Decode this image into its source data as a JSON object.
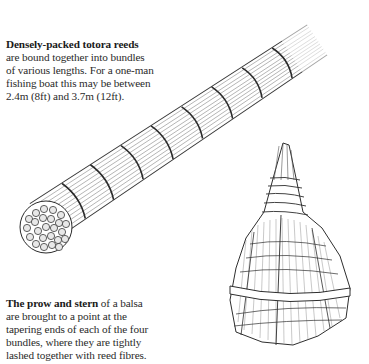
{
  "captions": [
    {
      "id": "reed-bundle",
      "bold_lead": "Densely-packed totora reeds",
      "lines": [
        "are bound together into bundles",
        "of various lengths. For a one-man",
        "fishing boat this may be between",
        "2.4m (8ft) and 3.7m (12ft)."
      ]
    },
    {
      "id": "prow-stern",
      "bold_lead": "The prow and stern",
      "lead_rest": " of a balsa",
      "lines": [
        "are brought to a point at the",
        "tapering ends of each of the four",
        "bundles, where they are tightly",
        "lashed together with reed fibres."
      ]
    }
  ],
  "illustrations": [
    {
      "name": "reed-bundle-illustration",
      "description": "Long diagonal bundle of reeds bound with lashings, cut end showing circular reed ends"
    },
    {
      "name": "prow-illustration",
      "description": "Tapering pointed prow of a reed boat with wrapped lashings"
    }
  ],
  "colors": {
    "ink": "#2a2a2a",
    "background": "#ffffff"
  }
}
